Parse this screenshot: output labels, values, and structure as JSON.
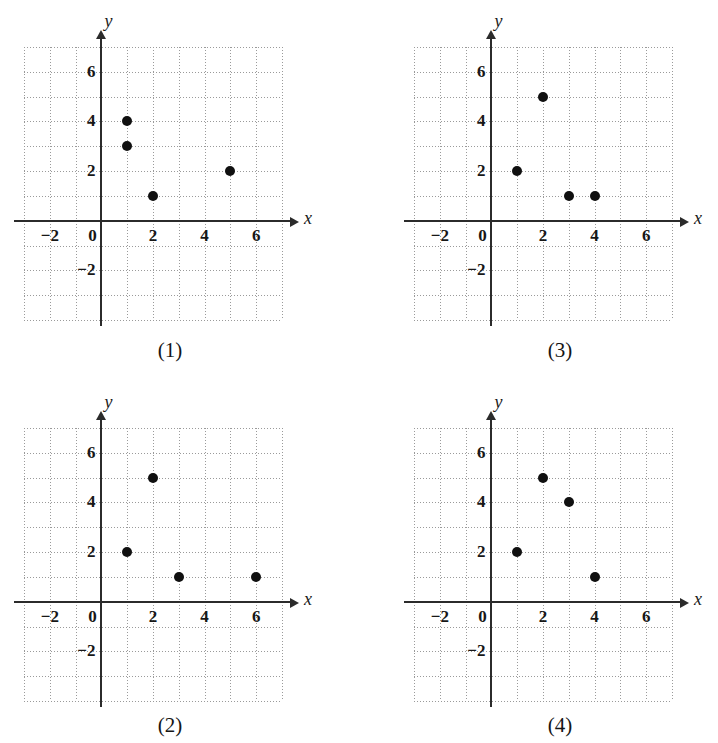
{
  "figure": {
    "kind": "multiple-choice-answer-graphs",
    "panel_count": 4
  },
  "axis": {
    "x_name": "x",
    "y_name": "y",
    "x_ticks": [
      "-2",
      "0",
      "2",
      "4",
      "6"
    ],
    "x_tick_values": [
      -2,
      0,
      2,
      4,
      6
    ],
    "y_ticks": [
      "6",
      "4",
      "2",
      "-2"
    ],
    "y_tick_values": [
      6,
      4,
      2,
      -2
    ],
    "xlim": [
      -3,
      7
    ],
    "ylim": [
      -4,
      7
    ],
    "grid": true,
    "grid_color": "#9a9a9a",
    "axis_color": "#2b2b2b",
    "point_color": "#101010"
  },
  "chart_data": [
    {
      "type": "scatter",
      "title": "(1)",
      "xlabel": "x",
      "ylabel": "y",
      "xlim": [
        -3,
        7
      ],
      "ylim": [
        -4,
        7
      ],
      "grid": true,
      "xticks": [
        -2,
        0,
        2,
        4,
        6
      ],
      "yticks": [
        -2,
        2,
        4,
        6
      ],
      "points": [
        {
          "x": 1,
          "y": 4
        },
        {
          "x": 1,
          "y": 3
        },
        {
          "x": 2,
          "y": 1
        },
        {
          "x": 5,
          "y": 2
        }
      ]
    },
    {
      "type": "scatter",
      "title": "(3)",
      "xlabel": "x",
      "ylabel": "y",
      "xlim": [
        -3,
        7
      ],
      "ylim": [
        -4,
        7
      ],
      "grid": true,
      "xticks": [
        -2,
        0,
        2,
        4,
        6
      ],
      "yticks": [
        -2,
        2,
        4,
        6
      ],
      "points": [
        {
          "x": 1,
          "y": 2
        },
        {
          "x": 2,
          "y": 5
        },
        {
          "x": 3,
          "y": 1
        },
        {
          "x": 4,
          "y": 1
        }
      ]
    },
    {
      "type": "scatter",
      "title": "(2)",
      "xlabel": "x",
      "ylabel": "y",
      "xlim": [
        -3,
        7
      ],
      "ylim": [
        -4,
        7
      ],
      "grid": true,
      "xticks": [
        -2,
        0,
        2,
        4,
        6
      ],
      "yticks": [
        -2,
        2,
        4,
        6
      ],
      "points": [
        {
          "x": 1,
          "y": 2
        },
        {
          "x": 2,
          "y": 5
        },
        {
          "x": 3,
          "y": 1
        },
        {
          "x": 6,
          "y": 1
        }
      ]
    },
    {
      "type": "scatter",
      "title": "(4)",
      "xlabel": "x",
      "ylabel": "y",
      "xlim": [
        -3,
        7
      ],
      "ylim": [
        -4,
        7
      ],
      "grid": true,
      "xticks": [
        -2,
        0,
        2,
        4,
        6
      ],
      "yticks": [
        -2,
        2,
        4,
        6
      ],
      "points": [
        {
          "x": 1,
          "y": 2
        },
        {
          "x": 2,
          "y": 5
        },
        {
          "x": 3,
          "y": 4
        },
        {
          "x": 4,
          "y": 1
        }
      ]
    }
  ],
  "panels": [
    {
      "id": "1",
      "caption": "(1)",
      "slot": "panel-1"
    },
    {
      "id": "3",
      "caption": "(3)",
      "slot": "panel-3"
    },
    {
      "id": "2",
      "caption": "(2)",
      "slot": "panel-2"
    },
    {
      "id": "4",
      "caption": "(4)",
      "slot": "panel-4"
    }
  ]
}
